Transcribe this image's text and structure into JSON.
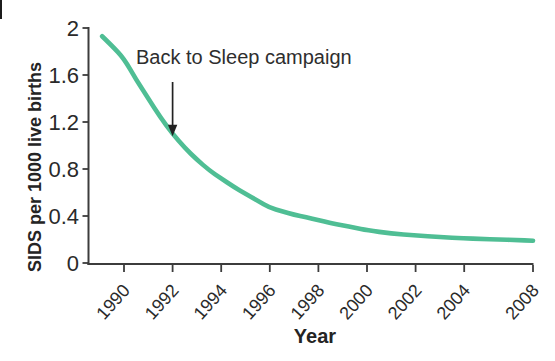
{
  "chart_data": {
    "type": "line",
    "title": "",
    "xlabel": "Year",
    "ylabel": "SIDS per 1000 live births",
    "x_ticks": [
      1990,
      1992,
      1994,
      1996,
      1998,
      2000,
      2002,
      2004,
      2008
    ],
    "y_tick_labels": [
      "0",
      "0.4",
      "0.8",
      "1.2",
      "1.6",
      "2"
    ],
    "ylim": [
      0,
      2
    ],
    "x_range_years": [
      1989.1,
      2008
    ],
    "grid": false,
    "legend": "none",
    "series": [
      {
        "name": "SIDS deaths per 1000 live births",
        "color": "#4fbe94",
        "points": [
          [
            1989.1,
            1.93
          ],
          [
            1989.5,
            1.85
          ],
          [
            1990,
            1.74
          ],
          [
            1990.5,
            1.56
          ],
          [
            1991,
            1.4
          ],
          [
            1991.5,
            1.24
          ],
          [
            1992,
            1.1
          ],
          [
            1992.5,
            0.98
          ],
          [
            1993,
            0.88
          ],
          [
            1993.5,
            0.79
          ],
          [
            1994,
            0.72
          ],
          [
            1994.5,
            0.65
          ],
          [
            1995,
            0.59
          ],
          [
            1995.5,
            0.53
          ],
          [
            1996,
            0.47
          ],
          [
            1996.5,
            0.44
          ],
          [
            1997,
            0.41
          ],
          [
            1997.5,
            0.39
          ],
          [
            1998,
            0.365
          ],
          [
            1998.5,
            0.34
          ],
          [
            1999,
            0.32
          ],
          [
            1999.5,
            0.3
          ],
          [
            2000,
            0.28
          ],
          [
            2001,
            0.25
          ],
          [
            2002,
            0.235
          ],
          [
            2003,
            0.22
          ],
          [
            2004,
            0.21
          ],
          [
            2005,
            0.205
          ],
          [
            2006,
            0.2
          ],
          [
            2007,
            0.195
          ],
          [
            2008,
            0.19
          ]
        ]
      }
    ],
    "annotation": {
      "text": "Back to Sleep campaign",
      "arrow_year": 1992,
      "arrow_value": 1.1
    }
  },
  "colors": {
    "curve": "#4fbe94",
    "axis": "#3c3c3c",
    "tick": "#3c3c3c",
    "text": "#2a2a2a",
    "arrow": "#222222"
  }
}
